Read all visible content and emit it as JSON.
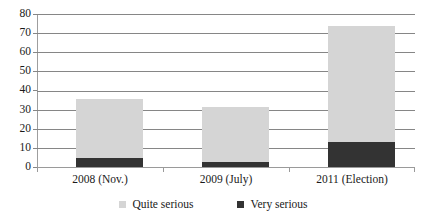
{
  "chart_data": {
    "type": "bar",
    "subtype": "stacked-bar",
    "title": "",
    "subtitle": "",
    "xlabel": "",
    "ylabel": "",
    "categories": [
      "2008 (Nov.)",
      "2009 (July)",
      "2011 (Election)"
    ],
    "series": [
      {
        "name": "Very serious",
        "values": [
          4.5,
          2.5,
          13.0
        ],
        "color": "#333333"
      },
      {
        "name": "Quite serious",
        "values": [
          31.0,
          29.0,
          60.5
        ],
        "color": "#d5d5d5"
      }
    ],
    "stack_order_bottom_to_top": [
      "Very serious",
      "Quite serious"
    ],
    "totals": [
      35.5,
      31.5,
      73.5
    ],
    "ylim": [
      0,
      80
    ],
    "ytick_step": 10,
    "yticks": [
      "80",
      "70",
      "60",
      "50",
      "40",
      "30",
      "20",
      "10",
      "0"
    ],
    "ytick_values": [
      80,
      70,
      60,
      50,
      40,
      30,
      20,
      10,
      0
    ],
    "grid": true,
    "grid_axis": "y",
    "legend_position": "bottom-center",
    "legend": [
      {
        "label": "Quite serious",
        "color": "#d5d5d5"
      },
      {
        "label": "Very serious",
        "color": "#333333"
      }
    ]
  },
  "axis": {
    "y_tick_0": "0",
    "y_tick_10": "10",
    "y_tick_20": "20",
    "y_tick_30": "30",
    "y_tick_40": "40",
    "y_tick_50": "50",
    "y_tick_60": "60",
    "y_tick_70": "70",
    "y_tick_80": "80"
  },
  "x_labels": {
    "cat0": "2008 (Nov.)",
    "cat1": "2009 (July)",
    "cat2": "2011 (Election)"
  },
  "legend_text": {
    "quite": "Quite serious",
    "very": "Very serious"
  },
  "colors": {
    "quite_serious": "#d5d5d5",
    "very_serious": "#333333",
    "gridline": "#868686",
    "axis": "#9e9e9e",
    "background": "#ffffff",
    "text": "#1a1a1a"
  }
}
